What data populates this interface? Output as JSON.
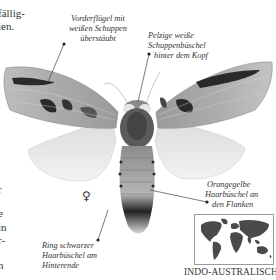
{
  "body_text_fragments": {
    "top_line_1": "fällig-",
    "top_line_2": "ien.",
    "left_lines": [
      "r",
      "",
      "e",
      "in",
      "r-",
      "",
      "n"
    ]
  },
  "annotations": {
    "forewing": [
      "Vorderflügel mit",
      "weißen Schuppen",
      "überstäubt"
    ],
    "head_tufts": [
      "Pelzige weiße",
      "Schuppenbüschel",
      "hinter dem Kopf"
    ],
    "flank_tufts": [
      "Orangegelbe",
      "Haarbüschel an",
      "den Flanken"
    ],
    "tail_ring": [
      "Ring schwarzer",
      "Haarbüschel am",
      "Hinterende"
    ]
  },
  "sex_symbol": "♀",
  "distribution": {
    "map_icon": "world-map-icon",
    "region": "INDO-AUSTRALISCH"
  },
  "colors": {
    "text": "#333333",
    "leader_line": "#444444",
    "map_land": "#4a4a4a",
    "map_border": "#9a9a9a"
  }
}
